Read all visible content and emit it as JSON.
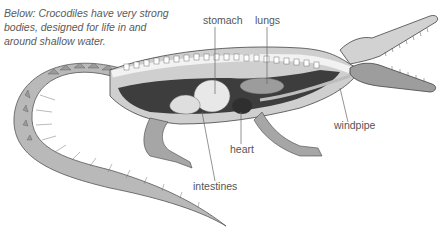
{
  "caption": {
    "lines": [
      "Below: Crocodiles have very strong",
      "bodies, designed for life in and",
      "around shallow water."
    ]
  },
  "labels": {
    "stomach": "stomach",
    "lungs": "lungs",
    "windpipe": "windpipe",
    "heart": "heart",
    "intestines": "intestines"
  },
  "colors": {
    "background": "#ffffff",
    "text": "#555555",
    "leader_line": "#666666",
    "body_light": "#d8d8d8",
    "body_mid": "#a8a8a8",
    "body_dark": "#3a3a3a"
  }
}
